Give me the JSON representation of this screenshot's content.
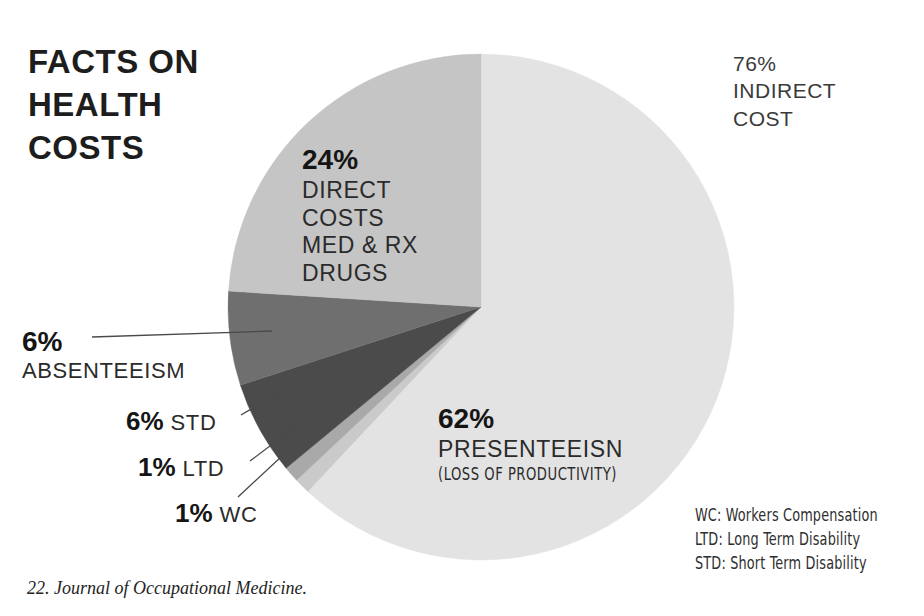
{
  "title": {
    "lines": [
      "FACTS ON",
      "HEALTH",
      "COSTS"
    ]
  },
  "labels": {
    "direct": {
      "pct": "24%",
      "lines": [
        "DIRECT",
        "COSTS",
        "MED & RX",
        "DRUGS"
      ]
    },
    "indirect": {
      "lines": [
        "76%",
        "INDIRECT",
        "COST"
      ]
    },
    "presenteeism": {
      "pct": "62%",
      "name": "PRESENTEEISN",
      "sub": "(LOSS OF PRODUCTIVITY)"
    },
    "absenteeism": {
      "pct": "6%",
      "name": "ABSENTEEISM"
    },
    "std": {
      "pct": "6%",
      "name": "STD"
    },
    "ltd": {
      "pct": "1%",
      "name": "LTD"
    },
    "wc": {
      "pct": "1%",
      "name": "WC"
    }
  },
  "legend": {
    "lines": [
      "WC: Workers Compensation",
      "LTD: Long Term Disability",
      "STD: Short Term Disability"
    ]
  },
  "footnote": {
    "text": "22. Journal of Occupational Medicine."
  },
  "chart_data": {
    "type": "pie",
    "title": "FACTS ON HEALTH COSTS",
    "start_angle_deg": 0,
    "direction": "clockwise",
    "center": [
      254,
      254
    ],
    "radius": 253,
    "grid": false,
    "legend": "bottom-right",
    "categories": [
      "PRESENTEEISN (LOSS OF PRODUCTIVITY)",
      "WC",
      "LTD",
      "STD",
      "ABSENTEEISM",
      "DIRECT COSTS MED & RX DRUGS"
    ],
    "values": [
      62,
      1,
      1,
      6,
      6,
      24
    ],
    "value_labels": [
      "62%",
      "1%",
      "1%",
      "6%",
      "6%",
      "24%"
    ],
    "colors": [
      "#e3e3e3",
      "#cacaca",
      "#a9a9a9",
      "#4b4b4b",
      "#6f6f6f",
      "#c5c5c5"
    ],
    "groups": [
      {
        "name": "INDIRECT COST",
        "value": 76,
        "label": "76%"
      },
      {
        "name": "DIRECT COST",
        "value": 24,
        "label": "24%"
      }
    ],
    "slices": [
      {
        "name": "PRESENTEEISN",
        "value": 62,
        "label": "62%",
        "color": "#e3e3e3",
        "start_deg": 0,
        "end_deg": 223.2,
        "group": "INDIRECT COST"
      },
      {
        "name": "WC",
        "value": 1,
        "label": "1%",
        "color": "#cacaca",
        "start_deg": 223.2,
        "end_deg": 226.8,
        "group": "INDIRECT COST"
      },
      {
        "name": "LTD",
        "value": 1,
        "label": "1%",
        "color": "#a9a9a9",
        "start_deg": 226.8,
        "end_deg": 230.4,
        "group": "INDIRECT COST"
      },
      {
        "name": "STD",
        "value": 6,
        "label": "6%",
        "color": "#4b4b4b",
        "start_deg": 230.4,
        "end_deg": 252.0,
        "group": "INDIRECT COST"
      },
      {
        "name": "ABSENTEEISM",
        "value": 6,
        "label": "6%",
        "color": "#6f6f6f",
        "start_deg": 252.0,
        "end_deg": 273.6,
        "group": "INDIRECT COST"
      },
      {
        "name": "DIRECT COSTS MED & RX DRUGS",
        "value": 24,
        "label": "24%",
        "color": "#c5c5c5",
        "start_deg": 273.6,
        "end_deg": 360.0,
        "group": "DIRECT COST"
      }
    ],
    "abbreviations": {
      "WC": "Workers Compensation",
      "LTD": "Long Term Disability",
      "STD": "Short Term Disability"
    },
    "source": "22. Journal of Occupational Medicine.",
    "total": 100
  }
}
